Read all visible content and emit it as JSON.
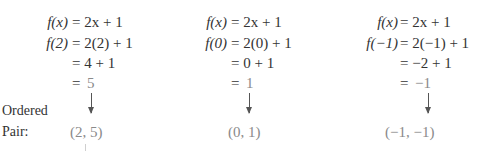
{
  "label": {
    "line1": "Ordered",
    "line2": "Pair:"
  },
  "columns": [
    {
      "rows": [
        {
          "lhs": "f(x)",
          "rhs": "= 2x + 1"
        },
        {
          "lhs": "f(2)",
          "rhs": "= 2(2) + 1"
        },
        {
          "lhs": "",
          "rhs": "= 4 + 1"
        },
        {
          "lhs": "",
          "eq": "=",
          "result": "5"
        }
      ],
      "pair": "(2, 5)"
    },
    {
      "rows": [
        {
          "lhs": "f(x)",
          "rhs": "= 2x + 1"
        },
        {
          "lhs": "f(0)",
          "rhs": "= 2(0) + 1"
        },
        {
          "lhs": "",
          "rhs": "= 0 + 1"
        },
        {
          "lhs": "",
          "eq": "=",
          "result": "1"
        }
      ],
      "pair": "(0, 1)"
    },
    {
      "rows": [
        {
          "lhs": "f(x)",
          "rhs": "= 2x + 1"
        },
        {
          "lhs": "f(−1)",
          "rhs": "= 2(−1) + 1"
        },
        {
          "lhs": "",
          "rhs": "= −2 + 1"
        },
        {
          "lhs": "",
          "eq": "=",
          "result": "−1"
        }
      ],
      "pair": "(−1, −1)"
    }
  ],
  "colors": {
    "text": "#333333",
    "highlight": "#8a8a8a",
    "arrow": "#555555"
  }
}
